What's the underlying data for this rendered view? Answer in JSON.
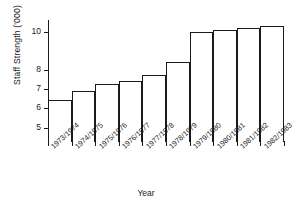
{
  "chart_data": {
    "type": "bar",
    "title": "",
    "xlabel": "Year",
    "ylabel": "Staff Strength ('000)",
    "categories": [
      "1973/1974",
      "1974/1975",
      "1975/1976",
      "1976/1977",
      "1977/1978",
      "1978/1979",
      "1979/1980",
      "1980/1981",
      "1981/1982",
      "1982/1983"
    ],
    "values": [
      6.45,
      6.9,
      7.25,
      7.45,
      7.75,
      8.4,
      10.0,
      10.1,
      10.2,
      10.3
    ],
    "ylim": [
      4.25,
      10.6
    ],
    "ytick_values": [
      5,
      6,
      7,
      8,
      10
    ],
    "ytick_labels": [
      "5",
      "6",
      "7",
      "8",
      "10"
    ],
    "grid": false,
    "legend": null,
    "bar_facecolor": "#ffffff",
    "bar_edgecolor": "#1a1a1a",
    "axis_color": "#1a1a1a",
    "background": "#ffffff"
  }
}
